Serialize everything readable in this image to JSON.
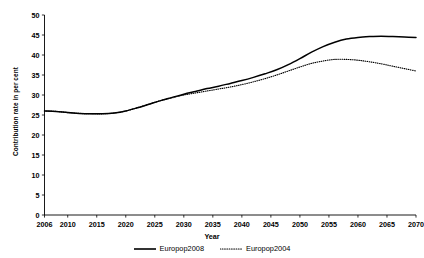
{
  "figure": {
    "clipped_caption": "",
    "background": "#ffffff",
    "line_color": "#000000"
  },
  "chart_data": {
    "type": "line",
    "title": "",
    "xlabel": "Year",
    "ylabel": "Contribution rate in per cent",
    "xlim": [
      2006,
      2070
    ],
    "ylim": [
      0,
      50
    ],
    "ytick_step": 5,
    "yticks": [
      0,
      5,
      10,
      15,
      20,
      25,
      30,
      35,
      40,
      45,
      50
    ],
    "xticks": [
      2006,
      2010,
      2015,
      2020,
      2025,
      2030,
      2035,
      2040,
      2045,
      2050,
      2055,
      2060,
      2065,
      2070
    ],
    "xticklabels": [
      "2006",
      "2010",
      "2015",
      "2020",
      "2025",
      "2030",
      "2035",
      "2040",
      "2045",
      "2050",
      "2055",
      "2060",
      "2065",
      "2070"
    ],
    "yticklabels": [
      "0",
      "5",
      "10",
      "15",
      "20",
      "25",
      "30",
      "35",
      "40",
      "45",
      "50"
    ],
    "grid": false,
    "legend_position": "bottom",
    "x": [
      2006,
      2008,
      2010,
      2012,
      2014,
      2016,
      2018,
      2020,
      2022,
      2024,
      2026,
      2028,
      2030,
      2032,
      2034,
      2036,
      2038,
      2040,
      2042,
      2044,
      2046,
      2048,
      2050,
      2052,
      2054,
      2056,
      2058,
      2060,
      2062,
      2064,
      2066,
      2068,
      2070
    ],
    "series": [
      {
        "name": "Europop2008",
        "style": "solid",
        "color": "#000000",
        "values": [
          26.0,
          25.9,
          25.6,
          25.4,
          25.3,
          25.3,
          25.5,
          26.0,
          26.8,
          27.7,
          28.6,
          29.4,
          30.2,
          30.9,
          31.6,
          32.2,
          32.9,
          33.6,
          34.4,
          35.3,
          36.3,
          37.6,
          39.1,
          40.7,
          42.1,
          43.2,
          44.0,
          44.4,
          44.6,
          44.7,
          44.6,
          44.5,
          44.4
        ]
      },
      {
        "name": "Europop2004",
        "style": "dotted",
        "color": "#000000",
        "values": [
          26.0,
          25.9,
          25.6,
          25.4,
          25.3,
          25.3,
          25.5,
          26.0,
          26.8,
          27.7,
          28.6,
          29.3,
          30.0,
          30.5,
          31.0,
          31.5,
          32.0,
          32.6,
          33.3,
          34.1,
          35.0,
          36.0,
          37.0,
          37.9,
          38.5,
          38.9,
          38.9,
          38.7,
          38.3,
          37.8,
          37.2,
          36.6,
          36.0
        ]
      }
    ],
    "legend_entries": [
      {
        "label": "Europop2008",
        "style": "solid"
      },
      {
        "label": "Europop2004",
        "style": "dotted"
      }
    ]
  }
}
